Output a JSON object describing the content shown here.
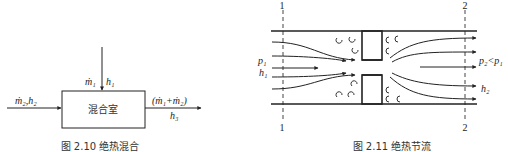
{
  "figure_left": {
    "chamber_label": "混合室",
    "inlet_top": {
      "m": "ṁ₁",
      "h": "h₁"
    },
    "inlet_left": {
      "label": "ṁ₂,h₂"
    },
    "outlet_right": {
      "m": "(ṁ₁+ṁ₂)",
      "h": "h₃"
    },
    "caption": "图 2.10   绝热混合"
  },
  "figure_right": {
    "section_1_label": "1",
    "section_2_label": "2",
    "inlet_p": "p₁",
    "inlet_h": "h₁",
    "outlet_p": "p₂<p₁",
    "outlet_h": "h₂",
    "caption": "图 2.11   绝热节流"
  },
  "colors": {
    "line": "#222222",
    "background": "#ffffff"
  }
}
